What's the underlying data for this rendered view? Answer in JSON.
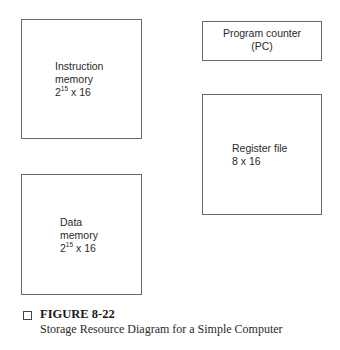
{
  "diagram": {
    "blocks": [
      {
        "id": "instruction-memory",
        "lines": [
          "Instruction",
          "memory"
        ],
        "size_base": "2",
        "size_exp": "15",
        "size_rest": " x 16"
      },
      {
        "id": "program-counter",
        "lines": [
          "Program counter",
          "(PC)"
        ]
      },
      {
        "id": "register-file",
        "lines": [
          "Register file",
          "8 x 16"
        ]
      },
      {
        "id": "data-memory",
        "lines": [
          "Data",
          "memory"
        ],
        "size_base": "2",
        "size_exp": "15",
        "size_rest": " x 16"
      }
    ]
  },
  "caption": {
    "marker": "checkbox-square",
    "title": "FIGURE 8-22",
    "subtitle": "Storage Resource Diagram for a Simple Computer"
  },
  "colors": {
    "border": "#6a6a6a",
    "text": "#2a2a2a",
    "background": "#ffffff"
  }
}
